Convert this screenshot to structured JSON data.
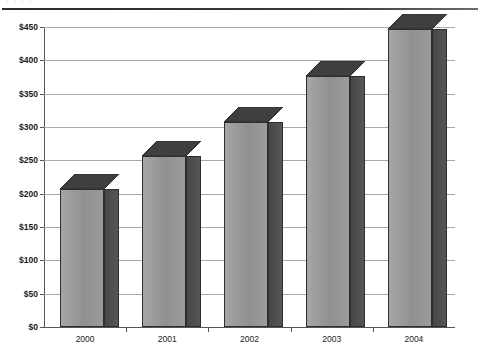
{
  "page": {
    "clipped_header_text": "· · · ·",
    "background": "#ffffff"
  },
  "chart_data": {
    "type": "bar",
    "title": "",
    "subtitle": "",
    "xlabel": "",
    "ylabel": "",
    "categories": [
      "2000",
      "2001",
      "2002",
      "2003",
      "2004"
    ],
    "values": [
      207,
      257,
      307,
      377,
      447
    ],
    "series": [
      {
        "name": "",
        "values": [
          207,
          257,
          307,
          377,
          447
        ]
      }
    ],
    "ylim": [
      0,
      450
    ],
    "ytick_values": [
      0,
      50,
      100,
      150,
      200,
      250,
      300,
      350,
      400,
      450
    ],
    "ytick_labels": [
      "$0",
      "$50",
      "$100",
      "$150",
      "$200",
      "$250",
      "$300",
      "$350",
      "$400",
      "$450"
    ],
    "currency_prefix": "$",
    "grid": true,
    "grid_axis": "y",
    "legend": false,
    "legend_position": "none",
    "three_d": true,
    "annotations": [],
    "colors": {
      "bar_front": "#9a9a9a",
      "bar_side": "#4d4d4d",
      "bar_top": "#3f3f3f",
      "bar_outline": "#2e2e2e",
      "gridline": "#a8a8a8",
      "axis": "#555555",
      "text": "#1a1a1a"
    }
  }
}
